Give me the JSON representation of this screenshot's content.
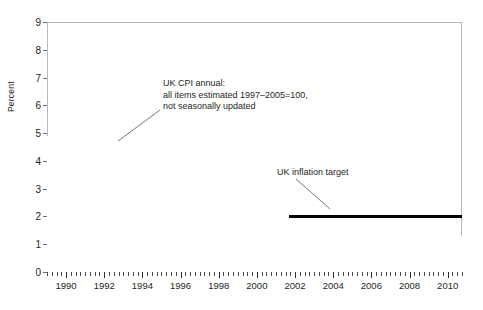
{
  "chart_data": {
    "type": "bar",
    "title": "",
    "xlabel": "",
    "ylabel": "Percent",
    "ylim": [
      0,
      9
    ],
    "xlim": [
      1989.0,
      2010.75
    ],
    "grid": false,
    "legend": "none",
    "y_ticks": [
      "0",
      "1",
      "2",
      "3",
      "4",
      "5",
      "6",
      "7",
      "8",
      "9"
    ],
    "x_ticks": [
      "1990",
      "1992",
      "1994",
      "1996",
      "1998",
      "2000",
      "2002",
      "2004",
      "2006",
      "2008",
      "2010"
    ],
    "x_tick_values": [
      1990,
      1992,
      1994,
      1996,
      1998,
      2000,
      2002,
      2004,
      2006,
      2008,
      2010
    ],
    "series_name": "UK CPI annual inflation rate",
    "x_start": 1989.0,
    "x_step": 0.0833333,
    "bar_color": "#949494",
    "values": [
      4.9,
      4.8,
      4.9,
      5.1,
      5.2,
      5.1,
      5.0,
      5.0,
      4.9,
      5.1,
      5.3,
      5.4,
      5.5,
      5.6,
      5.9,
      6.1,
      6.4,
      6.6,
      6.8,
      7.1,
      7.4,
      7.7,
      8.1,
      7.7,
      7.6,
      7.5,
      7.3,
      7.4,
      7.8,
      8.2,
      8.3,
      8.5,
      8.4,
      7.6,
      7.2,
      7.1,
      6.9,
      7.0,
      7.1,
      6.9,
      6.8,
      7.0,
      6.9,
      7.1,
      6.8,
      6.4,
      5.7,
      5.0,
      4.5,
      4.2,
      3.9,
      3.6,
      3.4,
      3.2,
      3.0,
      2.9,
      2.7,
      2.6,
      2.5,
      2.4,
      2.4,
      2.5,
      2.6,
      2.7,
      2.7,
      2.6,
      2.5,
      2.4,
      2.3,
      2.2,
      2.1,
      2.0,
      2.0,
      2.1,
      2.4,
      2.6,
      2.7,
      2.6,
      2.5,
      2.5,
      2.6,
      2.7,
      2.8,
      2.9,
      3.0,
      2.9,
      2.8,
      2.7,
      2.6,
      2.5,
      2.4,
      2.3,
      2.2,
      2.3,
      2.5,
      2.8,
      3.1,
      3.2,
      3.1,
      2.9,
      2.8,
      2.7,
      2.6,
      2.5,
      2.4,
      2.3,
      2.2,
      2.2,
      2.2,
      2.3,
      2.5,
      2.7,
      2.9,
      3.1,
      3.0,
      2.9,
      2.8,
      2.7,
      2.6,
      2.5,
      2.3,
      2.2,
      2.1,
      2.0,
      1.9,
      1.8,
      1.7,
      1.8,
      1.9,
      2.0,
      2.0,
      1.9,
      1.8,
      1.7,
      1.6,
      1.5,
      1.5,
      1.6,
      1.7,
      1.8,
      1.7,
      1.6,
      1.5,
      1.4,
      1.3,
      1.2,
      1.1,
      1.2,
      1.3,
      1.4,
      1.3,
      1.2,
      1.1,
      1.0,
      0.9,
      0.9,
      1.0,
      1.1,
      1.2,
      1.4,
      1.5,
      1.4,
      1.3,
      1.2,
      1.1,
      1.0,
      1.1,
      1.2,
      1.3,
      1.5,
      1.6,
      1.5,
      1.4,
      1.3,
      1.2,
      1.1,
      1.2,
      1.3,
      1.5,
      1.6,
      1.7,
      1.6,
      1.5,
      1.4,
      1.3,
      1.2,
      1.3,
      1.4,
      1.5,
      1.6,
      1.7,
      1.6,
      1.5,
      1.4,
      1.3,
      1.4,
      1.5,
      1.4,
      1.3,
      1.3,
      1.2,
      1.1,
      1.2,
      1.3,
      1.4,
      1.5,
      1.4,
      1.3,
      1.2,
      1.1,
      1.2,
      1.3,
      1.4,
      1.5,
      1.6,
      1.7,
      1.7,
      1.6,
      1.5,
      1.6,
      1.8,
      1.9,
      2.0,
      2.1,
      2.2,
      2.4,
      2.5,
      2.4,
      2.3,
      2.2,
      2.1,
      2.0,
      2.1,
      2.3,
      2.4,
      2.5,
      2.4,
      2.5,
      2.7,
      2.9,
      3.0,
      2.9,
      3.1,
      3.0,
      2.8,
      2.5,
      2.4,
      2.3,
      2.4,
      2.5,
      2.7,
      3.0,
      3.4,
      3.8,
      4.2,
      4.5,
      4.8,
      5.2,
      4.9,
      4.5,
      4.1,
      3.6,
      3.1,
      2.6,
      2.2,
      1.9,
      1.6,
      1.5,
      1.4,
      1.5,
      1.6,
      1.8,
      2.1,
      2.4,
      2.8,
      3.0,
      3.2,
      3.4,
      3.5,
      3.6,
      3.4,
      3.2,
      3.1,
      3.2,
      3.3,
      3.2
    ],
    "target_line": {
      "label": "UK inflation target",
      "value": 2.0,
      "x_from": 2001.7,
      "x_to": 2010.75,
      "color": "#000000"
    },
    "annotations": [
      {
        "name": "cpi-series-annotation",
        "lines": [
          "UK CPI annual:",
          "all items estimated 1997–2005=100,",
          "not seasonally updated"
        ]
      }
    ]
  },
  "annotation_target_label": "UK inflation target"
}
